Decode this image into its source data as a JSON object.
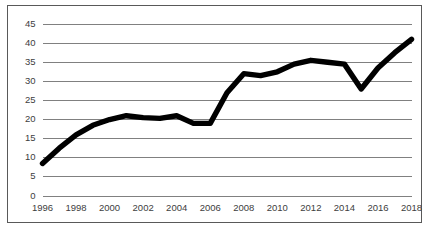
{
  "chart_data": {
    "type": "line",
    "title": "",
    "subtitle": "",
    "xlabel": "",
    "ylabel": "",
    "xlim": [
      1996,
      2018
    ],
    "ylim": [
      0,
      45
    ],
    "grid": "horizontal",
    "legend": "none",
    "line_color": "#000000",
    "grid_color": "#808080",
    "border_color": "#595959",
    "background_color": "#FFFFFF",
    "y_ticks": [
      0,
      5,
      10,
      15,
      20,
      25,
      30,
      35,
      40,
      45
    ],
    "y_tick_labels": [
      "0",
      "5",
      "10",
      "15",
      "20",
      "25",
      "30",
      "35",
      "40",
      "45"
    ],
    "x_ticks": [
      1996,
      1998,
      2000,
      2002,
      2004,
      2006,
      2008,
      2010,
      2012,
      2014,
      2016,
      2018
    ],
    "x_tick_labels": [
      "1996",
      "1998",
      "2000",
      "2002",
      "2004",
      "2006",
      "2008",
      "2010",
      "2012",
      "2014",
      "2016",
      "2018"
    ],
    "x": [
      1996,
      1997,
      1998,
      1999,
      2000,
      2001,
      2002,
      2003,
      2004,
      2005,
      2006,
      2007,
      2008,
      2009,
      2010,
      2011,
      2012,
      2013,
      2014,
      2015,
      2016,
      2017,
      2018
    ],
    "values": [
      8.5,
      12.5,
      16.0,
      18.5,
      20.0,
      21.0,
      20.5,
      20.3,
      21.0,
      19.0,
      19.0,
      27.0,
      32.0,
      31.5,
      32.5,
      34.5,
      35.5,
      35.0,
      34.5,
      28.0,
      33.5,
      37.5,
      41.0
    ],
    "series": [
      {
        "name": "",
        "values": [
          8.5,
          12.5,
          16.0,
          18.5,
          20.0,
          21.0,
          20.5,
          20.3,
          21.0,
          19.0,
          19.0,
          27.0,
          32.0,
          31.5,
          32.5,
          34.5,
          35.5,
          35.0,
          34.5,
          28.0,
          33.5,
          37.5,
          41.0
        ]
      }
    ]
  }
}
